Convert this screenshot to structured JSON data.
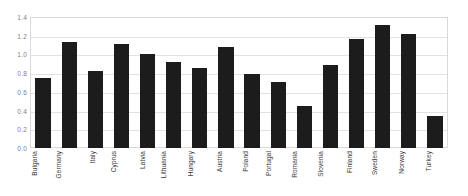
{
  "chart_data": {
    "type": "bar",
    "title": "",
    "subtitle": "",
    "xlabel": "",
    "ylabel": "",
    "ylim": [
      0.0,
      1.4
    ],
    "ytick_step": 0.2,
    "ytick_labels": [
      "1.4",
      "1.2",
      "1.0",
      "0.8",
      "0.6",
      "0.4",
      "0.2",
      "0.0"
    ],
    "ytick_values": [
      1.4,
      1.2,
      1.0,
      0.8,
      0.6,
      0.4,
      0.2,
      0.0
    ],
    "grid": "horizontal",
    "legend": "none",
    "bar_color": "#1c1c1c",
    "gridline_color": "#e2e2e2",
    "plot_border_color": "#d9d9d9",
    "background_color": "#ffffff",
    "xtick_rotation": 90,
    "categories": [
      "Bulgaria",
      "Germany",
      "Italy",
      "Cyprus",
      "Latvia",
      "Lithuania",
      "Hungary",
      "Austria",
      "Poland",
      "Portugal",
      "Romania",
      "Slovenia",
      "Finland",
      "Sweden",
      "Norway",
      "Turkey"
    ],
    "values": [
      0.75,
      1.13,
      0.82,
      1.11,
      1.01,
      0.92,
      0.86,
      1.08,
      0.79,
      0.71,
      0.45,
      0.89,
      1.16,
      1.31,
      1.22,
      0.34
    ]
  }
}
